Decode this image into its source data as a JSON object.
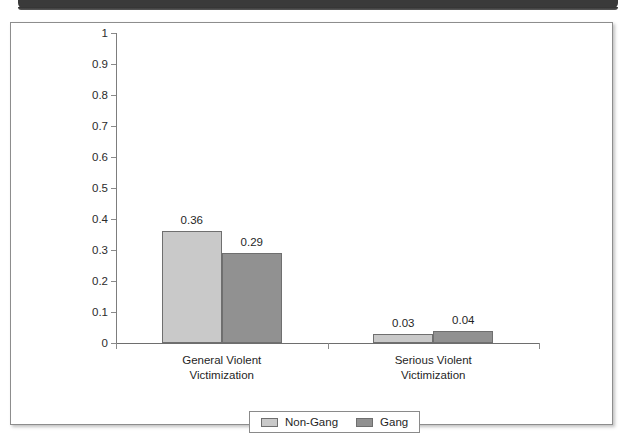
{
  "chart_data": {
    "type": "bar",
    "title": "",
    "xlabel": "",
    "ylabel": "",
    "ylim": [
      0,
      1
    ],
    "y_ticks": [
      "1",
      "0.9",
      "0.8",
      "0.7",
      "0.6",
      "0.5",
      "0.4",
      "0.3",
      "0.2",
      "0.1",
      "0"
    ],
    "y_tick_values": [
      1,
      0.9,
      0.8,
      0.7,
      0.6,
      0.5,
      0.4,
      0.3,
      0.2,
      0.1,
      0
    ],
    "grid": false,
    "legend_position": "bottom-center",
    "categories": [
      "General Violent Victimization",
      "Serious Violent Victimization"
    ],
    "category_lines": [
      [
        "General Violent",
        "Victimization"
      ],
      [
        "Serious Violent",
        "Victimization"
      ]
    ],
    "series": [
      {
        "name": "Non-Gang",
        "color": "#c9c9c9",
        "values": [
          0.36,
          0.03
        ],
        "labels": [
          "0.36",
          "0.03"
        ]
      },
      {
        "name": "Gang",
        "color": "#919191",
        "values": [
          0.29,
          0.04
        ],
        "labels": [
          "0.29",
          "0.04"
        ]
      }
    ]
  },
  "legend": {
    "entries": [
      {
        "label": "Non-Gang",
        "swatch": "#c9c9c9"
      },
      {
        "label": "Gang",
        "swatch": "#919191"
      }
    ]
  },
  "colors": {
    "non_gang": "#c9c9c9",
    "gang": "#919191",
    "axis": "#7d7d7d",
    "frame": "#8d8d8d",
    "page_band": "#3a3a3a"
  }
}
